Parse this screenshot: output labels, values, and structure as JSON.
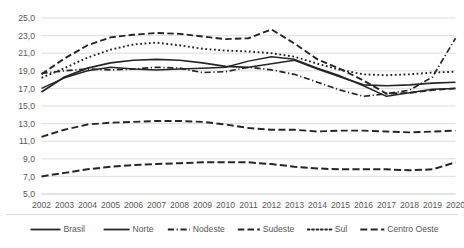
{
  "chart_data": {
    "type": "line",
    "title": "",
    "subtitle": "",
    "xlabel": "",
    "ylabel": "",
    "grid": true,
    "legend_position": "bottom",
    "ylim": [
      5.0,
      25.0
    ],
    "ytick_step": 2.0,
    "decimal_separator": ",",
    "ytick_labels": [
      "5,0",
      "7,0",
      "9,0",
      "11,0",
      "13,0",
      "15,0",
      "17,0",
      "19,0",
      "21,0",
      "23,0",
      "25,0"
    ],
    "ytick_values": [
      5.0,
      7.0,
      9.0,
      11.0,
      13.0,
      15.0,
      17.0,
      19.0,
      21.0,
      23.0,
      25.0
    ],
    "categories": [
      "2002",
      "2003",
      "2004",
      "2005",
      "2006",
      "2007",
      "2008",
      "2009",
      "2010",
      "2011",
      "2012",
      "2013",
      "2014",
      "2015",
      "2016",
      "2017",
      "2018",
      "2019",
      "2020"
    ],
    "x": [
      2002,
      2003,
      2004,
      2005,
      2006,
      2007,
      2008,
      2009,
      2010,
      2011,
      2012,
      2013,
      2014,
      2015,
      2016,
      2017,
      2018,
      2019,
      2020
    ],
    "series": [
      {
        "name": "Brasil",
        "style": "solid",
        "color": "#262626",
        "width": 1.7,
        "values": [
          16.6,
          18.3,
          19.3,
          19.9,
          20.2,
          20.3,
          20.2,
          19.9,
          19.5,
          19.4,
          19.8,
          20.2,
          19.2,
          18.3,
          17.4,
          17.3,
          17.4,
          17.6,
          17.7
        ]
      },
      {
        "name": "Norte",
        "style": "solid",
        "color": "#262626",
        "width": 1.5,
        "values": [
          17.0,
          18.2,
          19.0,
          19.4,
          19.2,
          19.1,
          19.2,
          19.3,
          19.4,
          20.1,
          20.6,
          20.3,
          19.3,
          18.4,
          17.3,
          16.1,
          16.5,
          16.9,
          17.0
        ]
      },
      {
        "name": "Nodeste",
        "style": "dashdot",
        "color": "#262626",
        "width": 1.7,
        "values": [
          18.7,
          19.0,
          19.2,
          19.1,
          19.2,
          19.4,
          19.3,
          18.8,
          18.9,
          19.4,
          19.1,
          18.6,
          17.7,
          16.8,
          16.1,
          16.4,
          16.8,
          18.3,
          22.7
        ]
      },
      {
        "name": "Sudeste",
        "style": "dashed",
        "color": "#262626",
        "width": 1.9,
        "values": [
          18.6,
          20.4,
          21.9,
          22.8,
          23.1,
          23.3,
          23.2,
          22.9,
          22.6,
          22.7,
          23.7,
          22.1,
          20.3,
          19.2,
          17.9,
          16.4,
          16.5,
          16.8,
          17.0
        ]
      },
      {
        "name": "Sul",
        "style": "dotted",
        "color": "#262626",
        "width": 1.9,
        "values": [
          18.2,
          19.3,
          20.5,
          21.4,
          22.0,
          22.2,
          21.9,
          21.5,
          21.3,
          21.2,
          21.0,
          20.6,
          19.8,
          19.1,
          18.6,
          18.5,
          18.6,
          18.8,
          18.9
        ]
      },
      {
        "name": "Centro Oeste",
        "style": "dashed-long",
        "color": "#262626",
        "width": 1.9,
        "values": [
          11.5,
          12.3,
          12.9,
          13.1,
          13.2,
          13.3,
          13.3,
          13.2,
          12.9,
          12.5,
          12.3,
          12.3,
          12.1,
          12.2,
          12.2,
          12.1,
          12.0,
          12.1,
          12.2
        ]
      },
      {
        "name": "Centro Oeste Lower",
        "style": "dashed-low",
        "color": "#262626",
        "width": 2.0,
        "hidden_from_legend": true,
        "values": [
          7.0,
          7.4,
          7.8,
          8.1,
          8.3,
          8.4,
          8.5,
          8.6,
          8.6,
          8.6,
          8.4,
          8.1,
          7.9,
          7.8,
          7.8,
          7.8,
          7.7,
          7.8,
          8.6
        ]
      }
    ],
    "legend_entries": [
      {
        "label": "Brasil",
        "style": "solid"
      },
      {
        "label": "Norte",
        "style": "solid"
      },
      {
        "label": "Nodeste",
        "style": "dashdot"
      },
      {
        "label": "Sudeste",
        "style": "dashed"
      },
      {
        "label": "Sul",
        "style": "dotted"
      },
      {
        "label": "Centro Oeste",
        "style": "dashed-long"
      }
    ],
    "colors": {
      "background": "#fefefe",
      "gridline": "#d9d9d9",
      "line": "#262626",
      "text": "#595959"
    }
  }
}
